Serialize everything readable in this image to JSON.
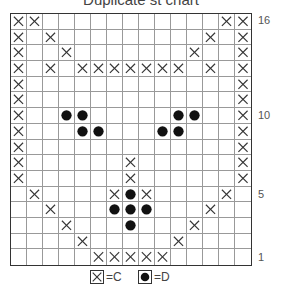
{
  "chart_data": {
    "type": "table",
    "title": "Duplicate st chart",
    "columns": 15,
    "rows": 16,
    "row_labels": [
      {
        "row": 16,
        "label": "16"
      },
      {
        "row": 10,
        "label": "10"
      },
      {
        "row": 5,
        "label": "5"
      },
      {
        "row": 1,
        "label": "1"
      }
    ],
    "legend": [
      {
        "symbol": "X",
        "label": "=C",
        "meaning": "color C"
      },
      {
        "symbol": "dot",
        "label": "=D",
        "meaning": "color D"
      }
    ],
    "grid_rows_top_to_bottom": [
      {
        "row": 16,
        "C": [
          0,
          1,
          13,
          14
        ],
        "D": []
      },
      {
        "row": 15,
        "C": [
          0,
          2,
          12,
          14
        ],
        "D": []
      },
      {
        "row": 14,
        "C": [
          0,
          3,
          11,
          14
        ],
        "D": []
      },
      {
        "row": 13,
        "C": [
          0,
          2,
          4,
          5,
          6,
          7,
          8,
          9,
          10,
          12,
          14
        ],
        "D": []
      },
      {
        "row": 12,
        "C": [
          0,
          14
        ],
        "D": []
      },
      {
        "row": 11,
        "C": [
          0,
          14
        ],
        "D": []
      },
      {
        "row": 10,
        "C": [
          0,
          14
        ],
        "D": [
          3,
          4,
          10,
          11
        ]
      },
      {
        "row": 9,
        "C": [
          0,
          14
        ],
        "D": [
          4,
          5,
          9,
          10
        ]
      },
      {
        "row": 8,
        "C": [
          0,
          14
        ],
        "D": []
      },
      {
        "row": 7,
        "C": [
          0,
          7,
          14
        ],
        "D": []
      },
      {
        "row": 6,
        "C": [
          0,
          7,
          14
        ],
        "D": []
      },
      {
        "row": 5,
        "C": [
          1,
          6,
          8,
          13
        ],
        "D": [
          7
        ]
      },
      {
        "row": 4,
        "C": [
          2,
          12
        ],
        "D": [
          6,
          7,
          8
        ]
      },
      {
        "row": 3,
        "C": [
          3,
          11
        ],
        "D": [
          7
        ]
      },
      {
        "row": 2,
        "C": [
          4,
          10
        ],
        "D": []
      },
      {
        "row": 1,
        "C": [
          5,
          6,
          7,
          8,
          9
        ],
        "D": []
      }
    ]
  },
  "colors": {
    "grid_line": "#999999",
    "border": "#333333",
    "symbol": "#333333",
    "dot": "#111111"
  }
}
